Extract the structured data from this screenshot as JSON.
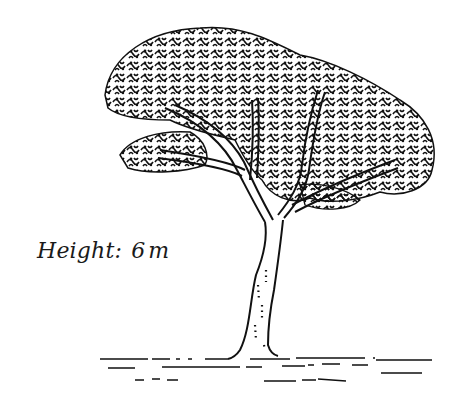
{
  "figure": {
    "caption": {
      "label": "Height:",
      "value": "6",
      "unit": "m"
    },
    "colors": {
      "ink": "#111111",
      "background": "#ffffff"
    }
  }
}
